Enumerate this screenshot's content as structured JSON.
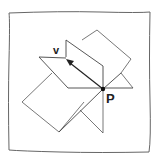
{
  "diagram": {
    "labels": {
      "vector": "v",
      "point": "P"
    },
    "colors": {
      "stroke": "#333333",
      "frame": "#555555",
      "background": "#ffffff"
    }
  }
}
